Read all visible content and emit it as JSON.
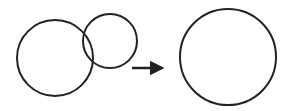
{
  "diagram": {
    "stroke_color": "#222222",
    "left_group": {
      "large_circle": {
        "cx": 55,
        "cy": 58,
        "r": 38
      },
      "small_circle": {
        "cx": 110,
        "cy": 41,
        "r": 27
      }
    },
    "arrow": {
      "x1": 132,
      "y1": 68,
      "x2": 162,
      "y2": 68,
      "direction": "right"
    },
    "result_circle": {
      "cx": 228,
      "cy": 57,
      "r": 48
    }
  }
}
